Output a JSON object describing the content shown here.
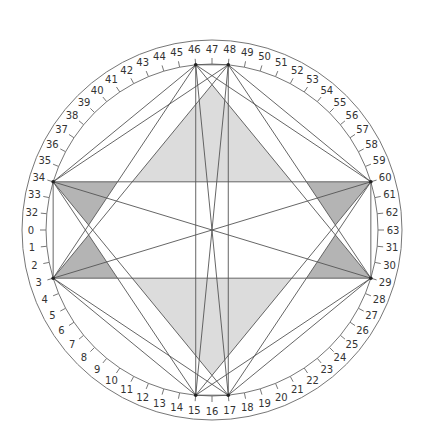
{
  "diagram": {
    "center": [
      212,
      230
    ],
    "radius_outer": 190,
    "radius_inner": 166,
    "radius_tick": 172,
    "radius_label": 181,
    "labels_clockwise_from_left": [
      "0",
      "32",
      "33",
      "34",
      "35",
      "36",
      "37",
      "38",
      "39",
      "40",
      "41",
      "42",
      "43",
      "44",
      "45",
      "46",
      "47",
      "48",
      "49",
      "50",
      "51",
      "52",
      "53",
      "54",
      "55",
      "56",
      "57",
      "58",
      "59",
      "60",
      "61",
      "62",
      "63",
      "31",
      "30",
      "29",
      "28",
      "27",
      "26",
      "25",
      "24",
      "23",
      "22",
      "21",
      "20",
      "19",
      "18",
      "17",
      "16",
      "15",
      "14",
      "13",
      "12",
      "11",
      "10",
      "9",
      "8",
      "7",
      "6",
      "5",
      "4",
      "3",
      "2",
      "1"
    ],
    "vertices": [
      "46",
      "48",
      "60",
      "29",
      "17",
      "15",
      "3",
      "34"
    ],
    "chords": [
      [
        "34",
        "60"
      ],
      [
        "3",
        "29"
      ],
      [
        "34",
        "3"
      ],
      [
        "60",
        "29"
      ],
      [
        "34",
        "29"
      ],
      [
        "3",
        "60"
      ],
      [
        "46",
        "48"
      ],
      [
        "15",
        "17"
      ],
      [
        "46",
        "15"
      ],
      [
        "48",
        "17"
      ],
      [
        "46",
        "17"
      ],
      [
        "48",
        "15"
      ],
      [
        "46",
        "34"
      ],
      [
        "48",
        "34"
      ],
      [
        "46",
        "3"
      ],
      [
        "48",
        "3"
      ],
      [
        "46",
        "60"
      ],
      [
        "48",
        "60"
      ],
      [
        "46",
        "29"
      ],
      [
        "48",
        "29"
      ],
      [
        "15",
        "3"
      ],
      [
        "17",
        "3"
      ],
      [
        "15",
        "34"
      ],
      [
        "17",
        "34"
      ],
      [
        "15",
        "60"
      ],
      [
        "17",
        "60"
      ],
      [
        "15",
        "29"
      ],
      [
        "17",
        "29"
      ]
    ],
    "shaded_regions": [
      {
        "name": "upper-light-triangle",
        "color": "#dcdcdc",
        "lines": [
          [
            "48",
            "3"
          ],
          [
            "46",
            "29"
          ],
          [
            "34",
            "60"
          ]
        ]
      },
      {
        "name": "lower-light-triangle",
        "color": "#dcdcdc",
        "lines": [
          [
            "17",
            "34"
          ],
          [
            "15",
            "60"
          ],
          [
            "3",
            "29"
          ]
        ]
      },
      {
        "name": "upper-left-dark-triangle",
        "color": "#b4b4b4",
        "lines": [
          [
            "34",
            "17"
          ],
          [
            "46",
            "3"
          ],
          [
            "34",
            "60"
          ]
        ]
      },
      {
        "name": "lower-left-dark-triangle",
        "color": "#b4b4b4",
        "lines": [
          [
            "3",
            "48"
          ],
          [
            "15",
            "34"
          ],
          [
            "3",
            "29"
          ]
        ]
      },
      {
        "name": "upper-right-dark-triangle",
        "color": "#b4b4b4",
        "lines": [
          [
            "60",
            "15"
          ],
          [
            "48",
            "29"
          ],
          [
            "34",
            "60"
          ]
        ]
      },
      {
        "name": "lower-right-dark-triangle",
        "color": "#b4b4b4",
        "lines": [
          [
            "29",
            "46"
          ],
          [
            "17",
            "60"
          ],
          [
            "3",
            "29"
          ]
        ]
      }
    ],
    "colors": {
      "stroke": "#555555",
      "ring": "#777777",
      "text": "#333333"
    }
  }
}
